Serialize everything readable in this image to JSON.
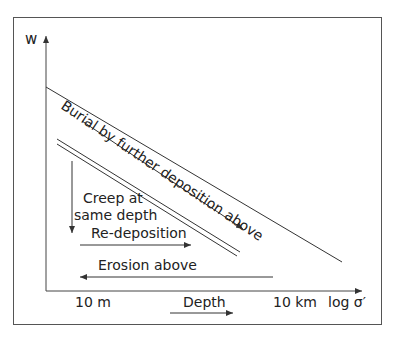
{
  "diagram": {
    "y_axis_label": "w",
    "x_axis_label": "log σ′",
    "x_ticks": [
      "10 m",
      "10 km"
    ],
    "depth_label": "Depth",
    "burial_label": "Burial by further deposition above",
    "creep_label_line1": "Creep at",
    "creep_label_line2": "same depth",
    "redeposition_label": "Re-deposition",
    "erosion_label": "Erosion above",
    "line_color": "#333333"
  }
}
